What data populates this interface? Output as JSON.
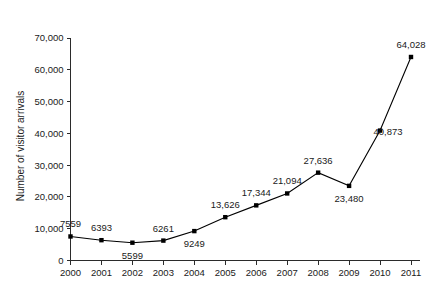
{
  "figure": {
    "top_caption_fragment": "",
    "background_color": "#ffffff",
    "ink_color": "#000000"
  },
  "chart_data": {
    "type": "line",
    "title": "",
    "xlabel": "",
    "ylabel": "Number of visitor arrivals",
    "categories": [
      "2000",
      "2001",
      "2002",
      "2003",
      "2004",
      "2005",
      "2006",
      "2007",
      "2008",
      "2009",
      "2010",
      "2011"
    ],
    "values": [
      7559,
      6393,
      5599,
      6261,
      9249,
      13626,
      17344,
      21094,
      27636,
      23480,
      40873,
      64028
    ],
    "point_labels": [
      "7559",
      "6393",
      "5599",
      "6261",
      "9249",
      "13,626",
      "17,344",
      "21,094",
      "27,636",
      "23,480",
      "40,873",
      "64,028"
    ],
    "point_label_positions": [
      "above",
      "above",
      "below",
      "above",
      "below",
      "above",
      "above",
      "above",
      "above",
      "below",
      "right",
      "above"
    ],
    "ylim": [
      0,
      70000
    ],
    "yticks": [
      0,
      10000,
      20000,
      30000,
      40000,
      50000,
      60000,
      70000
    ],
    "ytick_labels": [
      "0",
      "10,000",
      "20,000",
      "30,000",
      "40,000",
      "50,000",
      "60,000",
      "70,000"
    ],
    "grid": false,
    "legend": false,
    "marker": "square",
    "marker_color": "#000000",
    "line_color": "#000000"
  }
}
